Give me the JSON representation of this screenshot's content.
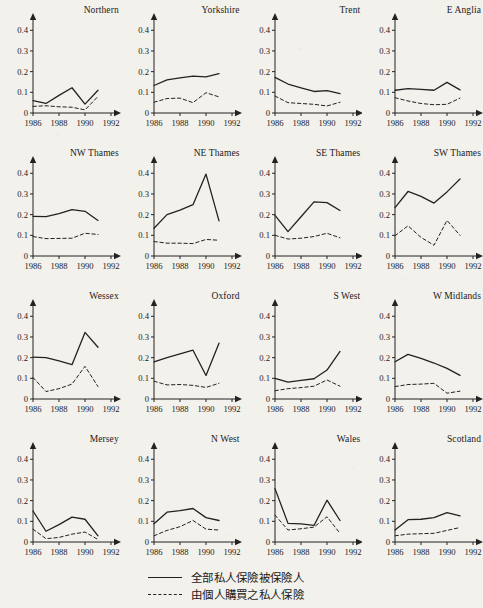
{
  "figure": {
    "kind": "small-multiples-line-chart-grid",
    "rows": 4,
    "cols": 4,
    "background_color": "#f3f1ec",
    "line_color": "#222222"
  },
  "legend": {
    "position": "bottom-center",
    "entries": [
      {
        "style": "solid",
        "label": "全部私人保險被保險人"
      },
      {
        "style": "dashed",
        "label": "由個人購買之私人保險"
      }
    ]
  },
  "axes": {
    "y_ticks": [
      "0",
      "0.1",
      "0.2",
      "0.3",
      "0.4"
    ],
    "y_values": [
      0,
      0.1,
      0.2,
      0.3,
      0.4
    ],
    "x_ticks": [
      "1986",
      "1988",
      "1990",
      "1992"
    ],
    "x_values": [
      1986,
      1988,
      1990,
      1992
    ],
    "xlim": [
      1986,
      1992
    ],
    "ylim": [
      0,
      0.44
    ],
    "grid": false
  },
  "chart_data": {
    "type": "line",
    "title": "",
    "xlabel": "",
    "ylabel": "",
    "xlim": [
      1986,
      1992
    ],
    "ylim": [
      0,
      0.44
    ],
    "x": [
      1986,
      1987,
      1988,
      1989,
      1990,
      1991
    ],
    "grid": false,
    "legend": [
      "全部私人保險被保險人",
      "由個人購買之私人保險"
    ],
    "panels": [
      {
        "title": "Northern",
        "series": [
          {
            "name": "全部私人保險被保險人",
            "style": "solid",
            "values": [
              0.06,
              0.046,
              0.085,
              0.122,
              0.043,
              0.11
            ]
          },
          {
            "name": "由個人購買之私人保險",
            "style": "dashed",
            "values": [
              0.032,
              0.035,
              0.03,
              0.028,
              0.015,
              0.08
            ]
          }
        ]
      },
      {
        "title": "Yorkshire",
        "series": [
          {
            "name": "全部私人保險被保險人",
            "style": "solid",
            "values": [
              0.133,
              0.16,
              0.17,
              0.178,
              0.175,
              0.19
            ]
          },
          {
            "name": "由個人購買之私人保險",
            "style": "dashed",
            "values": [
              0.052,
              0.07,
              0.072,
              0.05,
              0.098,
              0.078
            ]
          }
        ]
      },
      {
        "title": "Trent",
        "series": [
          {
            "name": "全部私人保險被保險人",
            "style": "solid",
            "values": [
              0.172,
              0.14,
              0.122,
              0.104,
              0.108,
              0.094
            ]
          },
          {
            "name": "由個人購買之私人保險",
            "style": "dashed",
            "values": [
              0.082,
              0.05,
              0.046,
              0.042,
              0.034,
              0.052
            ]
          }
        ]
      },
      {
        "title": "E Anglia",
        "series": [
          {
            "name": "全部私人保險被保險人",
            "style": "solid",
            "values": [
              0.11,
              0.118,
              0.114,
              0.11,
              0.148,
              0.112
            ]
          },
          {
            "name": "由個人購買之私人保險",
            "style": "dashed",
            "values": [
              0.074,
              0.058,
              0.046,
              0.04,
              0.042,
              0.072
            ]
          }
        ]
      },
      {
        "title": "NW Thames",
        "series": [
          {
            "name": "全部私人保險被保險人",
            "style": "solid",
            "values": [
              0.192,
              0.19,
              0.205,
              0.224,
              0.216,
              0.172
            ]
          },
          {
            "name": "由個人購買之私人保險",
            "style": "dashed",
            "values": [
              0.094,
              0.084,
              0.085,
              0.086,
              0.11,
              0.104
            ]
          }
        ]
      },
      {
        "title": "NE Thames",
        "series": [
          {
            "name": "全部私人保險被保險人",
            "style": "solid",
            "values": [
              0.134,
              0.2,
              0.222,
              0.248,
              0.396,
              0.17
            ]
          },
          {
            "name": "由個人購買之私人保險",
            "style": "dashed",
            "values": [
              0.07,
              0.062,
              0.062,
              0.06,
              0.08,
              0.076
            ]
          }
        ]
      },
      {
        "title": "SE Thames",
        "series": [
          {
            "name": "全部私人保險被保險人",
            "style": "solid",
            "values": [
              0.196,
              0.118,
              0.19,
              0.262,
              0.258,
              0.22
            ]
          },
          {
            "name": "由個人購買之私人保險",
            "style": "dashed",
            "values": [
              0.1,
              0.082,
              0.086,
              0.094,
              0.11,
              0.088
            ]
          }
        ]
      },
      {
        "title": "SW Thames",
        "series": [
          {
            "name": "全部私人保險被保險人",
            "style": "solid",
            "values": [
              0.234,
              0.312,
              0.288,
              0.256,
              0.31,
              0.372
            ]
          },
          {
            "name": "由個人購買之私人保險",
            "style": "dashed",
            "values": [
              0.098,
              0.146,
              0.09,
              0.052,
              0.172,
              0.1
            ]
          }
        ]
      },
      {
        "title": "Wessex",
        "series": [
          {
            "name": "全部私人保險被保險人",
            "style": "solid",
            "values": [
              0.202,
              0.2,
              0.184,
              0.166,
              0.322,
              0.25
            ]
          },
          {
            "name": "由個人購買之私人保險",
            "style": "dashed",
            "values": [
              0.104,
              0.036,
              0.05,
              0.072,
              0.158,
              0.06
            ]
          }
        ]
      },
      {
        "title": "Oxford",
        "series": [
          {
            "name": "全部私人保險被保險人",
            "style": "solid",
            "values": [
              0.18,
              0.2,
              0.218,
              0.236,
              0.114,
              0.27
            ]
          },
          {
            "name": "由個人購買之私人保險",
            "style": "dashed",
            "values": [
              0.086,
              0.068,
              0.07,
              0.066,
              0.056,
              0.076
            ]
          }
        ]
      },
      {
        "title": "S West",
        "series": [
          {
            "name": "全部私人保險被保險人",
            "style": "solid",
            "values": [
              0.1,
              0.082,
              0.09,
              0.098,
              0.14,
              0.23
            ]
          },
          {
            "name": "由個人購買之私人保險",
            "style": "dashed",
            "values": [
              0.04,
              0.05,
              0.055,
              0.062,
              0.092,
              0.062
            ]
          }
        ]
      },
      {
        "title": "W Midlands",
        "series": [
          {
            "name": "全部私人保險被保險人",
            "style": "solid",
            "values": [
              0.18,
              0.216,
              0.196,
              0.174,
              0.148,
              0.114
            ]
          },
          {
            "name": "由個人購買之私人保險",
            "style": "dashed",
            "values": [
              0.06,
              0.07,
              0.072,
              0.076,
              0.028,
              0.038
            ]
          }
        ]
      },
      {
        "title": "Mersey",
        "series": [
          {
            "name": "全部私人保險被保險人",
            "style": "solid",
            "values": [
              0.15,
              0.052,
              0.084,
              0.12,
              0.11,
              0.03
            ]
          },
          {
            "name": "由個人購買之私人保險",
            "style": "dashed",
            "values": [
              0.062,
              0.016,
              0.022,
              0.038,
              0.048,
              0.012
            ]
          }
        ]
      },
      {
        "title": "N West",
        "series": [
          {
            "name": "全部私人保險被保險人",
            "style": "solid",
            "values": [
              0.088,
              0.144,
              0.152,
              0.162,
              0.118,
              0.104
            ]
          },
          {
            "name": "由個人購買之私人保險",
            "style": "dashed",
            "values": [
              0.03,
              0.056,
              0.074,
              0.104,
              0.062,
              0.058
            ]
          }
        ]
      },
      {
        "title": "Wales",
        "series": [
          {
            "name": "全部私人保險被保險人",
            "style": "solid",
            "values": [
              0.258,
              0.09,
              0.088,
              0.08,
              0.202,
              0.104
            ]
          },
          {
            "name": "由個人購買之私人保險",
            "style": "dashed",
            "values": [
              0.13,
              0.058,
              0.064,
              0.072,
              0.122,
              0.042
            ]
          }
        ]
      },
      {
        "title": "Scotland",
        "series": [
          {
            "name": "全部私人保險被保險人",
            "style": "solid",
            "values": [
              0.058,
              0.108,
              0.11,
              0.118,
              0.142,
              0.126
            ]
          },
          {
            "name": "由個人購買之私人保險",
            "style": "dashed",
            "values": [
              0.03,
              0.038,
              0.04,
              0.042,
              0.056,
              0.07
            ]
          }
        ]
      }
    ]
  }
}
